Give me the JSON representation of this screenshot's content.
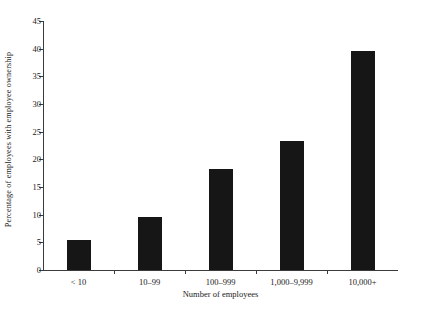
{
  "chart_data": {
    "type": "bar",
    "title": "",
    "xlabel": "Number of employees",
    "ylabel": "Percentage of employees with employee ownership",
    "categories": [
      "< 10",
      "10–99",
      "100–999",
      "1,000–9,999",
      "10,000+"
    ],
    "values": [
      5.4,
      9.6,
      18.3,
      23.3,
      39.6
    ],
    "ylim": [
      0,
      45
    ],
    "yticks": [
      0,
      5,
      10,
      15,
      20,
      25,
      30,
      35,
      40,
      45
    ],
    "ytick_labels": [
      "0",
      "5",
      "10",
      "15",
      "20",
      "25",
      "30",
      "35",
      "40",
      "45"
    ],
    "grid": false,
    "legend": "none",
    "bar_color": "#161616",
    "axis_color": "#3b3b3b",
    "background_color": "#ffffff"
  }
}
